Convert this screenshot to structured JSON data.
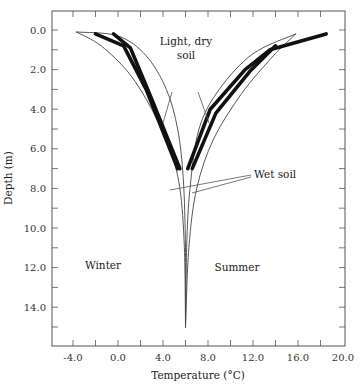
{
  "chart_data": {
    "type": "line",
    "title": "",
    "xlabel": "Temperature (°C)",
    "ylabel": "Depth (m)",
    "xlim": [
      -5.9,
      20.2
    ],
    "ylim": [
      16.0,
      -1.0
    ],
    "y_inverted": true,
    "grid": false,
    "x_ticks": [
      "-4.0",
      "0.0",
      "4.0",
      "8.0",
      "12.0",
      "16.0",
      "20.0"
    ],
    "y_ticks": [
      "0.0",
      "2.0",
      "4.0",
      "6.0",
      "8.0",
      "10.0",
      "12.0",
      "14.0"
    ],
    "annotations": [
      {
        "text_line1": "Light, dry",
        "text_line2": "soil"
      },
      {
        "text": "Wet soil"
      },
      {
        "text": "Winter"
      },
      {
        "text": "Summer"
      }
    ],
    "series": [
      {
        "name": "Winter envelope (light, dry soil)",
        "style": "thin",
        "points": [
          [
            -3.7,
            0.1
          ],
          [
            -1.5,
            0.8
          ],
          [
            1.0,
            2.2
          ],
          [
            3.0,
            4.0
          ],
          [
            4.6,
            6.0
          ],
          [
            5.5,
            8.0
          ],
          [
            5.9,
            11.0
          ],
          [
            6.0,
            15.0
          ]
        ]
      },
      {
        "name": "Winter envelope (wet soil)",
        "style": "thin",
        "points": [
          [
            -3.7,
            0.1
          ],
          [
            0.0,
            0.3
          ],
          [
            2.5,
            1.3
          ],
          [
            4.3,
            3.0
          ],
          [
            5.3,
            5.0
          ],
          [
            5.8,
            7.5
          ],
          [
            6.0,
            11.0
          ],
          [
            6.0,
            15.0
          ]
        ]
      },
      {
        "name": "Summer envelope (wet soil)",
        "style": "thin",
        "points": [
          [
            6.0,
            15.0
          ],
          [
            6.1,
            11.0
          ],
          [
            6.4,
            8.0
          ],
          [
            7.2,
            5.0
          ],
          [
            9.0,
            3.0
          ],
          [
            12.0,
            1.2
          ],
          [
            15.8,
            0.2
          ]
        ]
      },
      {
        "name": "Summer envelope (light, dry soil)",
        "style": "thin",
        "points": [
          [
            6.0,
            15.0
          ],
          [
            6.3,
            11.0
          ],
          [
            7.0,
            8.0
          ],
          [
            8.5,
            5.5
          ],
          [
            11.0,
            3.2
          ],
          [
            13.5,
            1.5
          ],
          [
            14.5,
            0.9
          ],
          [
            15.8,
            0.2
          ]
        ]
      },
      {
        "name": "Winter measured A",
        "style": "thick",
        "points": [
          [
            -2.0,
            0.2
          ],
          [
            0.5,
            0.8
          ],
          [
            2.5,
            3.0
          ],
          [
            5.3,
            7.0
          ]
        ]
      },
      {
        "name": "Winter measured B",
        "style": "thick",
        "points": [
          [
            -0.4,
            0.2
          ],
          [
            1.1,
            0.9
          ],
          [
            3.0,
            3.5
          ],
          [
            5.5,
            7.0
          ]
        ]
      },
      {
        "name": "Summer measured A",
        "style": "thick",
        "points": [
          [
            6.2,
            7.0
          ],
          [
            8.2,
            4.0
          ],
          [
            11.3,
            2.0
          ],
          [
            13.5,
            1.0
          ],
          [
            18.5,
            0.2
          ]
        ]
      },
      {
        "name": "Summer measured B",
        "style": "thick",
        "points": [
          [
            6.6,
            7.0
          ],
          [
            8.7,
            4.2
          ],
          [
            11.7,
            2.1
          ],
          [
            14.0,
            0.8
          ]
        ]
      }
    ]
  }
}
